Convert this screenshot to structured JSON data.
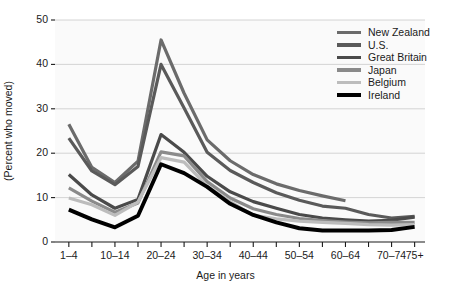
{
  "chart_data": {
    "type": "line",
    "title": "",
    "xlabel": "Age in years",
    "ylabel": "(Percent who moved)",
    "ylim": [
      0,
      50
    ],
    "yticks": [
      0,
      10,
      20,
      30,
      40,
      50
    ],
    "grid": true,
    "legend_position": "top-right",
    "categories": [
      "1–4",
      "5–9",
      "10–14",
      "15–19",
      "20–24",
      "25–29",
      "30–34",
      "35–39",
      "40–44",
      "45–49",
      "50–54",
      "55–59",
      "60–64",
      "65–69",
      "70–74",
      "75+"
    ],
    "tick_labels": [
      "1–4",
      "",
      "10–14",
      "",
      "20–24",
      "",
      "30–34",
      "",
      "40–44",
      "",
      "50–54",
      "",
      "60–64",
      "",
      "70–74",
      "75+"
    ],
    "series": [
      {
        "name": "New Zealand",
        "color": "#6b6b6b",
        "width": 3.2,
        "values": [
          26.5,
          16.8,
          13.4,
          18.2,
          45.5,
          33.5,
          23.0,
          18.3,
          15.2,
          13.1,
          11.6,
          10.4,
          9.3,
          null,
          null,
          null
        ]
      },
      {
        "name": "U.S.",
        "color": "#5a5a5a",
        "width": 3.2,
        "values": [
          23.4,
          16.0,
          12.9,
          17.0,
          40.0,
          30.2,
          20.2,
          16.1,
          13.4,
          11.1,
          9.4,
          8.1,
          7.6,
          6.2,
          5.4,
          5.8
        ]
      },
      {
        "name": "Great Britain",
        "color": "#4a4a4a",
        "width": 3.2,
        "values": [
          15.2,
          10.6,
          7.6,
          9.6,
          24.2,
          20.2,
          14.8,
          11.3,
          9.1,
          7.6,
          6.2,
          5.4,
          5.0,
          4.7,
          4.9,
          5.6
        ]
      },
      {
        "name": "Japan",
        "color": "#8a8a8a",
        "width": 3.2,
        "values": [
          12.2,
          9.2,
          6.7,
          8.8,
          20.3,
          19.4,
          13.6,
          9.9,
          7.5,
          6.2,
          5.3,
          4.8,
          4.5,
          4.3,
          4.4,
          4.4
        ]
      },
      {
        "name": "Belgium",
        "color": "#bcbcbc",
        "width": 3.2,
        "values": [
          9.9,
          8.4,
          6.0,
          9.0,
          19.0,
          18.0,
          12.6,
          9.1,
          6.0,
          5.2,
          4.7,
          4.4,
          4.2,
          3.9,
          3.8,
          3.9
        ]
      },
      {
        "name": "Ireland",
        "color": "#000000",
        "width": 3.9,
        "values": [
          7.3,
          5.1,
          3.3,
          5.9,
          17.5,
          15.5,
          12.4,
          8.6,
          6.1,
          4.4,
          3.1,
          2.6,
          2.6,
          2.6,
          2.7,
          3.4
        ]
      }
    ]
  }
}
